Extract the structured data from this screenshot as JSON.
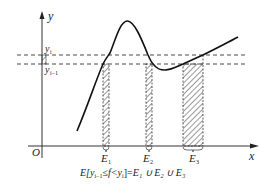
{
  "diagram": {
    "type": "lebesgue-partition-illustration",
    "axes": {
      "x_label": "x",
      "y_label": "y",
      "origin_label": "O"
    },
    "levels": [
      {
        "name": "y_i",
        "base": "y",
        "subscript": "i"
      },
      {
        "name": "y_{i-1}",
        "base": "y",
        "subscript": "i−1"
      }
    ],
    "sets": [
      {
        "base": "E",
        "subscript": "1"
      },
      {
        "base": "E",
        "subscript": "2"
      },
      {
        "base": "E",
        "subscript": "3"
      }
    ],
    "caption": {
      "prefix": "E[",
      "y_low_base": "y",
      "y_low_sub": "i−1",
      "relation": "≤f<",
      "y_high_base": "y",
      "y_high_sub": "i",
      "suffix": "]=",
      "union": "E₁ ∪ E₂ ∪ E₃",
      "full_text": "E[y_{i-1} ≤ f < y_i] = E1 ∪ E2 ∪ E3"
    },
    "colors": {
      "stroke": "#222222",
      "background": "#ffffff"
    }
  }
}
